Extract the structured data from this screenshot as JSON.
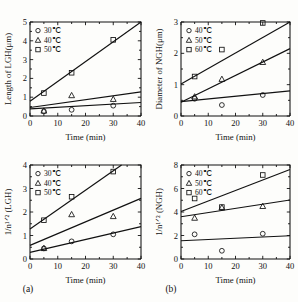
{
  "figure": {
    "panels": [
      {
        "key": "a",
        "label": "(a)"
      },
      {
        "key": "b",
        "label": "(b)"
      }
    ]
  },
  "chart_data": [
    {
      "id": "top-left",
      "type": "scatter",
      "title": "",
      "xlabel": "Time (min)",
      "ylabel": "Length of LGH(μm)",
      "xlim": [
        0,
        40
      ],
      "ylim": [
        0,
        5
      ],
      "xticks": [
        0,
        10,
        20,
        30,
        40
      ],
      "yticks": [
        0,
        1,
        2,
        3,
        4,
        5
      ],
      "grid": false,
      "legend_position": "top-left",
      "series": [
        {
          "name": "30℃",
          "marker": "circle",
          "x": [
            5,
            15,
            30
          ],
          "y": [
            0.25,
            0.33,
            0.55
          ],
          "fit": {
            "x": [
              0,
              40
            ],
            "y": [
              0.38,
              0.72
            ]
          }
        },
        {
          "name": "40℃",
          "marker": "triangle",
          "x": [
            5,
            15,
            30
          ],
          "y": [
            0.28,
            1.1,
            0.9
          ],
          "fit": {
            "x": [
              0,
              40
            ],
            "y": [
              0.45,
              1.28
            ]
          }
        },
        {
          "name": "50℃",
          "marker": "square",
          "x": [
            5,
            15,
            30
          ],
          "y": [
            1.22,
            2.3,
            4.05
          ],
          "fit": {
            "x": [
              0,
              40
            ],
            "y": [
              0.78,
              5.0
            ]
          }
        }
      ]
    },
    {
      "id": "top-right",
      "type": "scatter",
      "title": "",
      "xlabel": "Time (min)",
      "ylabel": "Diameter of NGH(μm)",
      "xlim": [
        0,
        40
      ],
      "ylim": [
        0,
        3
      ],
      "xticks": [
        0,
        10,
        20,
        30,
        40
      ],
      "yticks": [
        0,
        1,
        2,
        3
      ],
      "grid": false,
      "legend_position": "top-left",
      "series": [
        {
          "name": "40℃",
          "marker": "circle",
          "x": [
            5,
            15,
            30
          ],
          "y": [
            0.55,
            0.35,
            0.67
          ],
          "fit": {
            "x": [
              0,
              40
            ],
            "y": [
              0.46,
              0.8
            ]
          }
        },
        {
          "name": "50℃",
          "marker": "triangle",
          "x": [
            5,
            15,
            30
          ],
          "y": [
            0.62,
            1.18,
            1.72
          ],
          "fit": {
            "x": [
              0,
              40
            ],
            "y": [
              0.44,
              2.15
            ]
          }
        },
        {
          "name": "60℃",
          "marker": "square",
          "x": [
            5,
            15,
            30
          ],
          "y": [
            1.26,
            2.12,
            2.97
          ],
          "fit": {
            "x": [
              0,
              40
            ],
            "y": [
              1.02,
              3.0
            ]
          }
        }
      ]
    },
    {
      "id": "bottom-left",
      "type": "scatter",
      "title": "",
      "xlabel": "Time (min)",
      "ylabel": "1/n¹ᐟ² (LGH)",
      "xlim": [
        0,
        40
      ],
      "ylim": [
        0,
        4
      ],
      "xticks": [
        0,
        10,
        20,
        30,
        40
      ],
      "yticks": [
        0,
        1,
        2,
        3,
        4
      ],
      "grid": false,
      "legend_position": "top-left",
      "series": [
        {
          "name": "30℃",
          "marker": "circle",
          "x": [
            5,
            15,
            30
          ],
          "y": [
            0.45,
            0.75,
            1.05
          ],
          "fit": {
            "x": [
              0,
              40
            ],
            "y": [
              0.28,
              1.38
            ]
          }
        },
        {
          "name": "40℃",
          "marker": "triangle",
          "x": [
            5,
            15,
            30
          ],
          "y": [
            0.46,
            1.9,
            1.82
          ],
          "fit": {
            "x": [
              0,
              40
            ],
            "y": [
              0.58,
              2.58
            ]
          }
        },
        {
          "name": "50℃",
          "marker": "square",
          "x": [
            5,
            15,
            30
          ],
          "y": [
            1.65,
            2.65,
            3.72
          ],
          "fit": {
            "x": [
              0,
              33
            ],
            "y": [
              1.28,
              4.0
            ]
          }
        }
      ]
    },
    {
      "id": "bottom-right",
      "type": "scatter",
      "title": "",
      "xlabel": "Time (min)",
      "ylabel": "1/n¹ᐟ² (NGH)",
      "xlim": [
        0,
        40
      ],
      "ylim": [
        0,
        8
      ],
      "xticks": [
        0,
        10,
        20,
        30,
        40
      ],
      "yticks": [
        0,
        2,
        4,
        6,
        8
      ],
      "grid": false,
      "legend_position": "top-left",
      "series": [
        {
          "name": "40℃",
          "marker": "circle",
          "x": [
            5,
            15,
            30
          ],
          "y": [
            2.1,
            0.7,
            2.15
          ],
          "fit": {
            "x": [
              0,
              40
            ],
            "y": [
              1.55,
              1.98
            ]
          }
        },
        {
          "name": "50℃",
          "marker": "triangle",
          "x": [
            5,
            15,
            30
          ],
          "y": [
            3.5,
            4.38,
            4.5
          ],
          "fit": {
            "x": [
              0,
              40
            ],
            "y": [
              3.6,
              5.02
            ]
          }
        },
        {
          "name": "60℃",
          "marker": "square",
          "x": [
            5,
            15,
            30
          ],
          "y": [
            5.15,
            4.42,
            7.15
          ],
          "fit": {
            "x": [
              0,
              40
            ],
            "y": [
              4.05,
              7.62
            ]
          }
        }
      ]
    }
  ]
}
